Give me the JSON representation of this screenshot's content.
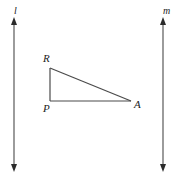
{
  "figure": {
    "type": "geometry-diagram",
    "width": 180,
    "height": 183,
    "background_color": "#ffffff",
    "stroke_color": "#4a4a4a",
    "text_color": "#222222",
    "lines": [
      {
        "name": "line-l",
        "label": "l",
        "orientation": "vertical",
        "x": 14,
        "y_top": 18,
        "y_bottom": 171,
        "arrowheads": "both",
        "label_x": 14,
        "label_y": 7
      },
      {
        "name": "line-m",
        "label": "m",
        "orientation": "vertical",
        "x": 163,
        "y_top": 18,
        "y_bottom": 171,
        "arrowheads": "both",
        "label_x": 163,
        "label_y": 7
      }
    ],
    "triangle": {
      "name": "triangle-PRA",
      "vertices": [
        {
          "label": "R",
          "x": 50,
          "y": 68,
          "label_x": 43,
          "label_y": 54
        },
        {
          "label": "P",
          "x": 50,
          "y": 101,
          "label_x": 43,
          "label_y": 104
        },
        {
          "label": "A",
          "x": 131,
          "y": 101,
          "label_x": 134,
          "label_y": 100
        }
      ],
      "sides": [
        {
          "name": "side-RP",
          "from": "R",
          "to": "P"
        },
        {
          "name": "side-PA",
          "from": "P",
          "to": "A"
        },
        {
          "name": "side-RA",
          "from": "R",
          "to": "A"
        }
      ],
      "right_angle_at": "P"
    }
  }
}
